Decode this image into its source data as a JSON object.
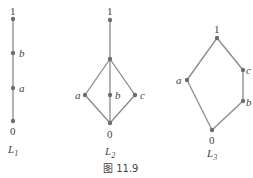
{
  "caption": "图 11.9",
  "colors": {
    "edge": "#8a8a8a",
    "node": "#6e6e6e",
    "text": "#444444"
  },
  "lattices": [
    {
      "name": "L1",
      "label_main": "L",
      "label_sub": "1",
      "nodes": [
        {
          "id": "1",
          "label": "1",
          "x": 13,
          "y": 19
        },
        {
          "id": "b",
          "label": "b",
          "x": 13,
          "y": 53
        },
        {
          "id": "a",
          "label": "a",
          "x": 13,
          "y": 88
        },
        {
          "id": "0",
          "label": "0",
          "x": 13,
          "y": 121
        }
      ],
      "edges": [
        [
          "0",
          "a"
        ],
        [
          "a",
          "b"
        ],
        [
          "b",
          "1"
        ]
      ]
    },
    {
      "name": "L2",
      "label_main": "L",
      "label_sub": "2",
      "nodes": [
        {
          "id": "1",
          "label": "1",
          "x": 110,
          "y": 20
        },
        {
          "id": "t",
          "label": "",
          "x": 110,
          "y": 59
        },
        {
          "id": "a",
          "label": "a",
          "x": 85,
          "y": 95
        },
        {
          "id": "b",
          "label": "b",
          "x": 110,
          "y": 95
        },
        {
          "id": "c",
          "label": "c",
          "x": 135,
          "y": 95
        },
        {
          "id": "0",
          "label": "0",
          "x": 110,
          "y": 123
        }
      ],
      "edges": [
        [
          "1",
          "t"
        ],
        [
          "t",
          "a"
        ],
        [
          "t",
          "b"
        ],
        [
          "t",
          "c"
        ],
        [
          "a",
          "0"
        ],
        [
          "b",
          "0"
        ],
        [
          "c",
          "0"
        ]
      ]
    },
    {
      "name": "L3",
      "label_main": "L",
      "label_sub": "3",
      "nodes": [
        {
          "id": "1",
          "label": "1",
          "x": 217,
          "y": 38
        },
        {
          "id": "c",
          "label": "c",
          "x": 243,
          "y": 70
        },
        {
          "id": "b",
          "label": "b",
          "x": 243,
          "y": 101
        },
        {
          "id": "a",
          "label": "a",
          "x": 187,
          "y": 80
        },
        {
          "id": "0",
          "label": "0",
          "x": 212,
          "y": 130
        }
      ],
      "edges": [
        [
          "1",
          "c"
        ],
        [
          "c",
          "b"
        ],
        [
          "b",
          "0"
        ],
        [
          "1",
          "a"
        ],
        [
          "a",
          "0"
        ]
      ]
    }
  ]
}
